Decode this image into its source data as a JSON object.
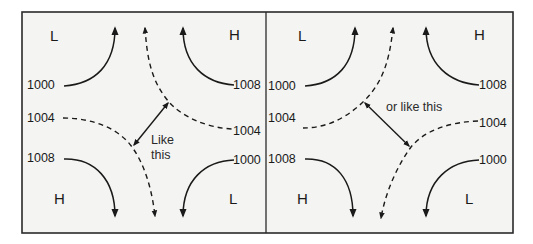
{
  "figure": {
    "colors": {
      "frame": "#2a2a2a",
      "background": "#f4f4f2",
      "lines": "#1a1a1a"
    },
    "panels": [
      {
        "id": "left",
        "pressure_centers": {
          "top_left": "L",
          "top_right": "H",
          "bottom_left": "H",
          "bottom_right": "L"
        },
        "isobar_labels": {
          "left_top": "1000",
          "left_mid": "1004",
          "left_bottom": "1008",
          "right_top": "1008",
          "right_mid": "1004",
          "right_bottom": "1000"
        },
        "annotation_line1": "Like",
        "annotation_line2": "this"
      },
      {
        "id": "right",
        "pressure_centers": {
          "top_left": "L",
          "top_right": "H",
          "bottom_left": "H",
          "bottom_right": "L"
        },
        "isobar_labels": {
          "left_top": "1000",
          "left_mid": "1004",
          "left_bottom": "1008",
          "right_top": "1008",
          "right_mid": "1004",
          "right_bottom": "1000"
        },
        "annotation": "or like this"
      }
    ]
  }
}
